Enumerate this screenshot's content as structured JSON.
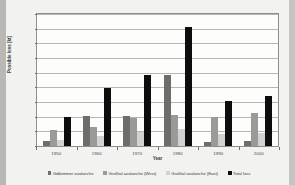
{
  "chart_data": {
    "type": "bar",
    "title": "",
    "xlabel": "Year",
    "ylabel": "Possible loss [kt]",
    "categories": [
      "1950",
      "1960",
      "1970",
      "1980",
      "1990",
      "2000"
    ],
    "ylim": [
      0,
      4500
    ],
    "yticks": [
      0,
      500,
      1000,
      1500,
      2000,
      2500,
      3000,
      3500,
      4000,
      4500
    ],
    "grid": true,
    "legend_position": "bottom",
    "series": [
      {
        "name": "Gidlommer avalanche",
        "color": "#6d6d6b",
        "values": [
          180,
          1030,
          1030,
          2420,
          130,
          160
        ]
      },
      {
        "name": "Großtal avalanche (West)",
        "color": "#9a9a98",
        "values": [
          560,
          640,
          950,
          1060,
          990,
          1140
        ]
      },
      {
        "name": "Großtal avalanche (East)",
        "color": "#d2d2d0",
        "values": [
          220,
          330,
          470,
          570,
          400,
          440
        ]
      },
      {
        "name": "Total loss",
        "color": "#0d0d0d",
        "values": [
          1000,
          1990,
          2430,
          4050,
          1520,
          1720
        ]
      }
    ]
  },
  "axis": {
    "y_title": "Possible loss [kt]",
    "x_title": "Year"
  }
}
